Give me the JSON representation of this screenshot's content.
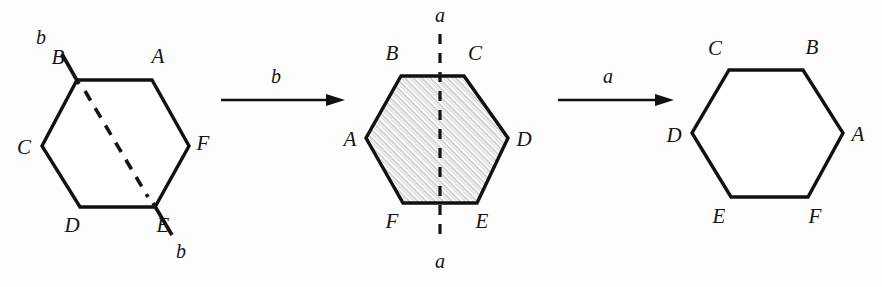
{
  "figure": {
    "background_color": "#fdfdfd",
    "ink_color": "#111111",
    "hatch_color": "#9a9a9a",
    "width": 882,
    "height": 287
  },
  "panels": [
    {
      "id": "panel-left",
      "name": "initial-hexagon",
      "shaded": false,
      "axis_kind": "diagonal-dashed",
      "axis_label": "b",
      "axis_label_top": "b",
      "axis_label_bottom": "b",
      "vertices": [
        {
          "letter": "B",
          "position": "top-left"
        },
        {
          "letter": "A",
          "position": "top-right"
        },
        {
          "letter": "C",
          "position": "left"
        },
        {
          "letter": "F",
          "position": "right"
        },
        {
          "letter": "D",
          "position": "bottom-left"
        },
        {
          "letter": "E",
          "position": "bottom-right"
        }
      ]
    },
    {
      "id": "panel-middle",
      "name": "hexagon-after-b",
      "shaded": true,
      "axis_kind": "vertical-dashed",
      "axis_label": "a",
      "axis_label_top": "a",
      "axis_label_bottom": "a",
      "vertices": [
        {
          "letter": "B",
          "position": "top-left"
        },
        {
          "letter": "C",
          "position": "top-right"
        },
        {
          "letter": "A",
          "position": "left"
        },
        {
          "letter": "D",
          "position": "right"
        },
        {
          "letter": "F",
          "position": "bottom-left"
        },
        {
          "letter": "E",
          "position": "bottom-right"
        }
      ]
    },
    {
      "id": "panel-right",
      "name": "hexagon-after-a",
      "shaded": false,
      "axis_kind": "none",
      "vertices": [
        {
          "letter": "C",
          "position": "top-left"
        },
        {
          "letter": "B",
          "position": "top-right"
        },
        {
          "letter": "D",
          "position": "left"
        },
        {
          "letter": "A",
          "position": "right"
        },
        {
          "letter": "E",
          "position": "bottom-left"
        },
        {
          "letter": "F",
          "position": "bottom-right"
        }
      ]
    }
  ],
  "arrows": [
    {
      "id": "arrow-1",
      "label": "b",
      "from": "panel-left",
      "to": "panel-middle"
    },
    {
      "id": "arrow-2",
      "label": "a",
      "from": "panel-middle",
      "to": "panel-right"
    }
  ]
}
